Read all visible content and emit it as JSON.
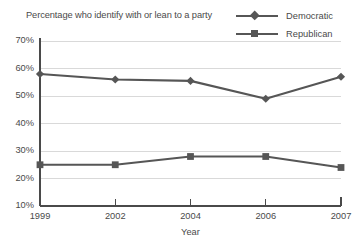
{
  "chart_data": {
    "type": "line",
    "title": "Percentage who identify with or lean to a party",
    "xlabel": "Year",
    "ylabel": "",
    "categories": [
      "1999",
      "2002",
      "2004",
      "2006",
      "2007"
    ],
    "series": [
      {
        "name": "Democratic",
        "marker": "diamond",
        "color": "#565656",
        "values": [
          58,
          56,
          55.5,
          49,
          57
        ]
      },
      {
        "name": "Republican",
        "marker": "square",
        "color": "#565656",
        "values": [
          25,
          25,
          28,
          28,
          24
        ]
      }
    ],
    "ylim": [
      10,
      70
    ],
    "ytick_values": [
      70,
      60,
      50,
      40,
      30,
      20,
      10
    ],
    "ytick_labels": [
      "70%",
      "60%",
      "50%",
      "40%",
      "30%",
      "20%",
      "10%"
    ],
    "grid": true,
    "grid_axis": "y",
    "legend_position": "top-right",
    "gridline_color": "#d9d9d9",
    "axis_color": "#4a4a4a"
  },
  "legend": {
    "items": [
      {
        "label": "Democratic"
      },
      {
        "label": "Republican"
      }
    ]
  }
}
